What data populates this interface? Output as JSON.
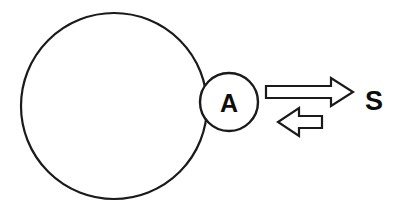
{
  "diagram": {
    "type": "schematic",
    "background_color": "#ffffff",
    "stroke_color": "#1a1a1a",
    "text_color": "#0d0d0d",
    "canvas": {
      "width": 402,
      "height": 208
    },
    "shapes": {
      "large_circle": {
        "name": "large-circle",
        "cx": 114,
        "cy": 106,
        "r": 93,
        "stroke_width": 2.2,
        "fill": "#ffffff",
        "label": ""
      },
      "small_circle": {
        "name": "small-circle",
        "cx": 229,
        "cy": 102,
        "r": 29,
        "stroke_width": 2.4,
        "fill": "#ffffff",
        "label": "A",
        "label_font_size": 25
      }
    },
    "arrows": {
      "forward": {
        "name": "forward-arrow",
        "direction": "right",
        "tail_x": 266,
        "tip_x": 353,
        "center_y": 92,
        "shaft_half_height": 6,
        "head_half_height": 14,
        "head_length": 22,
        "stroke_width": 2.2,
        "fill": "#ffffff"
      },
      "reverse": {
        "name": "reverse-arrow",
        "direction": "left",
        "tail_x": 322,
        "tip_x": 278,
        "center_y": 122,
        "shaft_half_height": 6,
        "head_half_height": 14,
        "head_length": 21,
        "stroke_width": 2.2,
        "fill": "#ffffff"
      }
    },
    "labels": {
      "inner_label": {
        "name": "label-a",
        "text": "A",
        "x": 229,
        "y": 103,
        "font_size": 25
      },
      "outer_label": {
        "name": "label-s",
        "text": "S",
        "x": 374,
        "y": 101,
        "font_size": 27
      }
    }
  }
}
